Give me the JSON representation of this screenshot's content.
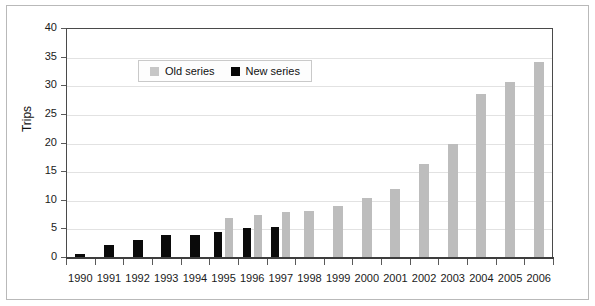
{
  "chart_data": {
    "type": "bar",
    "title": "",
    "xlabel": "",
    "ylabel": "Trips",
    "ylim": [
      0,
      40
    ],
    "ytick_step": 5,
    "yticks": [
      "0",
      "5",
      "10",
      "15",
      "20",
      "25",
      "30",
      "35",
      "40"
    ],
    "grid": true,
    "legend_position": "upper-left-inside",
    "categories": [
      "1990",
      "1991",
      "1992",
      "1993",
      "1994",
      "1995",
      "1996",
      "1997",
      "1998",
      "1999",
      "2000",
      "2001",
      "2002",
      "2003",
      "2004",
      "2005",
      "2006"
    ],
    "series": [
      {
        "name": "New series",
        "color": "#0a0a0a",
        "values": [
          0.6,
          2.1,
          3.0,
          3.8,
          3.8,
          4.4,
          5.0,
          5.2,
          null,
          null,
          null,
          null,
          null,
          null,
          null,
          null,
          null
        ]
      },
      {
        "name": "Old series",
        "color": "#bdbdbd",
        "values": [
          null,
          null,
          null,
          null,
          null,
          6.9,
          7.3,
          7.9,
          8.1,
          8.9,
          10.3,
          11.8,
          16.2,
          19.8,
          28.4,
          30.6,
          34.0
        ]
      }
    ]
  },
  "legend": {
    "entries": [
      {
        "label": "Old series",
        "swatch": "old"
      },
      {
        "label": "New series",
        "swatch": "new"
      }
    ]
  },
  "axes": {
    "y_axis_title": "Trips"
  },
  "colors": {
    "old_series": "#bdbdbd",
    "new_series": "#0a0a0a",
    "gridline": "#e2e2e2",
    "axis": "#4a4a4a",
    "outer_border": "#b9b9b9"
  }
}
